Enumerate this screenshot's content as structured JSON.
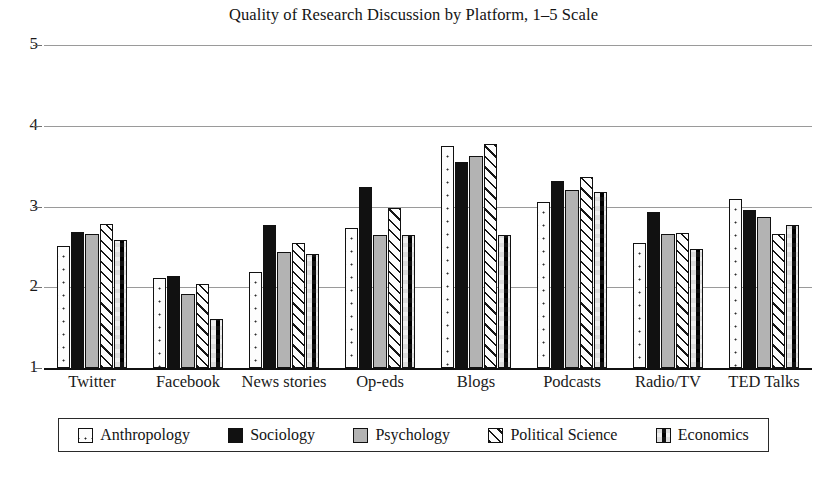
{
  "chart_data": {
    "type": "bar",
    "title": "Quality of Research Discussion by Platform, 1–5 Scale",
    "xlabel": "",
    "ylabel": "",
    "ylim": [
      1,
      5
    ],
    "yticks": [
      1,
      2,
      3,
      4,
      5
    ],
    "grid": true,
    "legend_position": "bottom",
    "categories": [
      "Twitter",
      "Facebook",
      "News stories",
      "Op-eds",
      "Blogs",
      "Podcasts",
      "Radio/TV",
      "TED Talks"
    ],
    "series": [
      {
        "name": "Anthropology",
        "pattern": "dotted",
        "color": "#fdfdfd",
        "values": [
          2.51,
          2.11,
          2.19,
          2.73,
          3.75,
          3.06,
          2.55,
          3.09
        ]
      },
      {
        "name": "Sociology",
        "pattern": "solid-black",
        "color": "#111111",
        "values": [
          2.68,
          2.14,
          2.77,
          3.24,
          3.55,
          3.32,
          2.93,
          2.96
        ]
      },
      {
        "name": "Psychology",
        "pattern": "solid-gray",
        "color": "#b3b3b3",
        "values": [
          2.66,
          1.92,
          2.44,
          2.65,
          3.62,
          3.2,
          2.66,
          2.87
        ]
      },
      {
        "name": "Political Science",
        "pattern": "diagonal-hatch",
        "color": "#fdfdfd",
        "values": [
          2.78,
          2.04,
          2.55,
          2.98,
          3.78,
          3.36,
          2.67,
          2.66
        ]
      },
      {
        "name": "Economics",
        "pattern": "checkerboard",
        "color": "#ffffff",
        "values": [
          2.59,
          1.61,
          2.41,
          2.65,
          2.65,
          3.18,
          2.47,
          2.77
        ]
      }
    ]
  },
  "axis": {
    "ytick_labels": [
      "1",
      "2",
      "3",
      "4",
      "5"
    ]
  }
}
